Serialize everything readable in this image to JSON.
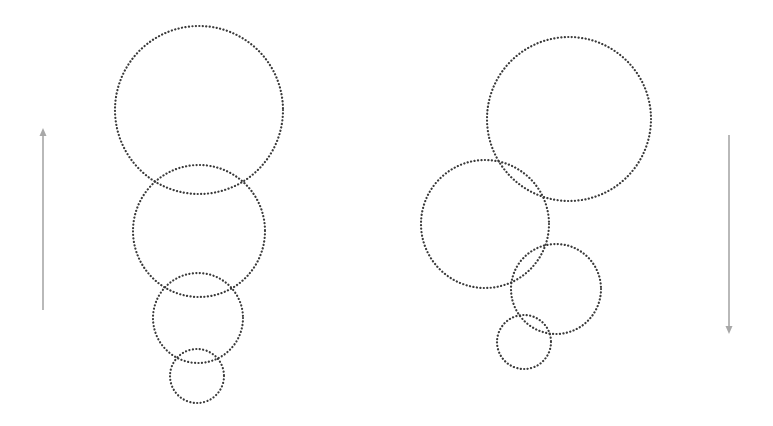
{
  "diagram": {
    "colors": {
      "circle_stroke": "#3a3a3a",
      "arrow": "#a8a8a8",
      "background": "#ffffff"
    },
    "left_group": {
      "arrow": {
        "direction": "up",
        "x": 43,
        "y_top": 130,
        "y_bottom": 310
      },
      "circles": [
        {
          "cx": 199,
          "cy": 110,
          "r": 84
        },
        {
          "cx": 199,
          "cy": 231,
          "r": 66
        },
        {
          "cx": 198,
          "cy": 318,
          "r": 45
        },
        {
          "cx": 197,
          "cy": 376,
          "r": 27
        }
      ]
    },
    "right_group": {
      "arrow": {
        "direction": "down",
        "x": 729,
        "y_top": 135,
        "y_bottom": 332
      },
      "circles": [
        {
          "cx": 569,
          "cy": 119,
          "r": 82
        },
        {
          "cx": 485,
          "cy": 224,
          "r": 64
        },
        {
          "cx": 556,
          "cy": 289,
          "r": 45
        },
        {
          "cx": 524,
          "cy": 342,
          "r": 27
        }
      ]
    }
  }
}
